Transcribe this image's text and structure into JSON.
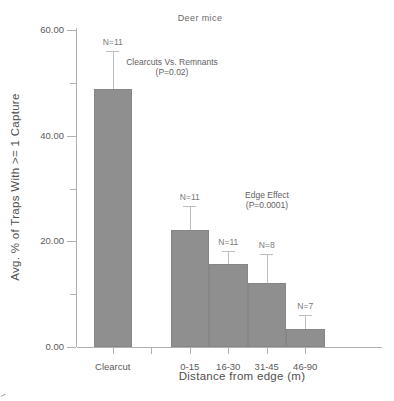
{
  "chart_data": {
    "type": "bar",
    "title": "Deer mice",
    "xlabel": "Distance from edge (m)",
    "ylabel": "Avg. % of Traps With >= 1 Capture",
    "ylim": [
      0,
      60
    ],
    "grid": "off",
    "legend": "none",
    "categories": [
      "Clearcut",
      "0-15",
      "16-30",
      "31-45",
      "46-90"
    ],
    "values": [
      48.9,
      22.1,
      15.7,
      12.1,
      3.4
    ],
    "error_upper": [
      7.1,
      4.6,
      2.5,
      5.5,
      2.6
    ],
    "n_labels": [
      "N=11",
      "N=11",
      "N=11",
      "N=8",
      "N=7"
    ],
    "slot_indices": [
      0,
      2,
      3,
      4,
      5
    ],
    "x_axis": {
      "tick_slots": [
        0,
        1,
        2,
        3,
        4,
        5
      ]
    },
    "y_axis": {
      "major_ticks": [
        {
          "value": 0,
          "label": "0.00"
        },
        {
          "value": 20,
          "label": "20.00"
        },
        {
          "value": 40,
          "label": "40.00"
        },
        {
          "value": 60,
          "label": "60.00"
        }
      ],
      "minor_ticks": [
        10,
        30,
        50
      ]
    },
    "annotations": [
      {
        "line1": "Clearcuts Vs. Remnants",
        "line2": "(P=0.02)"
      },
      {
        "line1": "Edge Effect",
        "line2": "(P=0.0001)"
      }
    ],
    "colors": {
      "bar": "#8f8f8f",
      "bar_edge": "#868686",
      "error_bar": "#bdbdbd",
      "axis": "#b0b0b0",
      "tick_text": "#5a5a5a",
      "n_label_text": "#7a7a7a",
      "annotation_text": "#616161",
      "title_text": "#6a6a6a"
    }
  }
}
